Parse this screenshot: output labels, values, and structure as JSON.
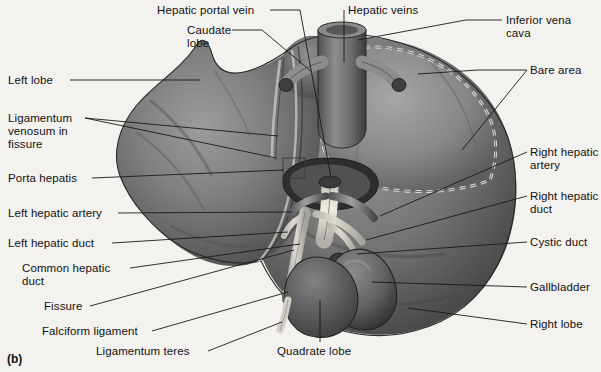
{
  "figure": {
    "caption": "(b)",
    "background_color": "#f3f2ef",
    "line_color": "#1a1a1a",
    "text_color": "#111111",
    "width": 601,
    "height": 372
  },
  "labels": [
    {
      "id": "hepatic-portal-vein",
      "text": "Hepatic portal vein",
      "side": "top",
      "x": 157,
      "y": 4,
      "align": "left"
    },
    {
      "id": "hepatic-veins",
      "text": "Hepatic veins",
      "side": "top",
      "x": 348,
      "y": 4,
      "align": "left"
    },
    {
      "id": "caudate-lobe",
      "text": "Caudate\nlobe",
      "side": "top",
      "x": 187,
      "y": 24,
      "align": "left"
    },
    {
      "id": "inferior-vena-cava",
      "text": "Inferior vena\ncava",
      "side": "right",
      "x": 506,
      "y": 14,
      "align": "left"
    },
    {
      "id": "left-lobe",
      "text": "Left lobe",
      "side": "left",
      "x": 8,
      "y": 74,
      "align": "left"
    },
    {
      "id": "bare-area",
      "text": "Bare area",
      "side": "right",
      "x": 530,
      "y": 64,
      "align": "left"
    },
    {
      "id": "ligamentum-venosum",
      "text": "Ligamentum\nvenosum in\nfissure",
      "side": "left",
      "x": 8,
      "y": 112,
      "align": "left"
    },
    {
      "id": "porta-hepatis",
      "text": "Porta hepatis",
      "side": "left",
      "x": 8,
      "y": 172,
      "align": "left"
    },
    {
      "id": "right-hepatic-artery",
      "text": "Right hepatic\nartery",
      "side": "right",
      "x": 530,
      "y": 146,
      "align": "left"
    },
    {
      "id": "right-hepatic-duct",
      "text": "Right hepatic\nduct",
      "side": "right",
      "x": 530,
      "y": 190,
      "align": "left"
    },
    {
      "id": "left-hepatic-artery",
      "text": "Left hepatic artery",
      "side": "left",
      "x": 8,
      "y": 207,
      "align": "left"
    },
    {
      "id": "left-hepatic-duct",
      "text": "Left hepatic duct",
      "side": "left",
      "x": 8,
      "y": 237,
      "align": "left"
    },
    {
      "id": "cystic-duct",
      "text": "Cystic duct",
      "side": "right",
      "x": 530,
      "y": 236,
      "align": "left"
    },
    {
      "id": "common-hepatic-duct",
      "text": "Common hepatic\nduct",
      "side": "left",
      "x": 22,
      "y": 262,
      "align": "left"
    },
    {
      "id": "gallbladder",
      "text": "Gallbladder",
      "side": "right",
      "x": 530,
      "y": 281,
      "align": "left"
    },
    {
      "id": "fissure",
      "text": "Fissure",
      "side": "left",
      "x": 44,
      "y": 300,
      "align": "left"
    },
    {
      "id": "right-lobe",
      "text": "Right lobe",
      "side": "right",
      "x": 530,
      "y": 318,
      "align": "left"
    },
    {
      "id": "falciform-ligament",
      "text": "Falciform ligament",
      "side": "left",
      "x": 42,
      "y": 325,
      "align": "left"
    },
    {
      "id": "ligamentum-teres",
      "text": "Ligamentum teres",
      "side": "left",
      "x": 96,
      "y": 345,
      "align": "left"
    },
    {
      "id": "quadrate-lobe",
      "text": "Quadrate lobe",
      "side": "bottom",
      "x": 277,
      "y": 345,
      "align": "left"
    }
  ],
  "anatomy_parts": [
    "left-lobe",
    "right-lobe",
    "caudate-lobe",
    "quadrate-lobe",
    "bare-area",
    "porta-hepatis",
    "gallbladder",
    "cystic-duct",
    "common-hepatic-duct",
    "right-hepatic-duct",
    "left-hepatic-duct",
    "right-hepatic-artery",
    "left-hepatic-artery",
    "hepatic-portal-vein",
    "hepatic-veins",
    "inferior-vena-cava",
    "ligamentum-venosum",
    "ligamentum-teres",
    "falciform-ligament",
    "fissure"
  ]
}
